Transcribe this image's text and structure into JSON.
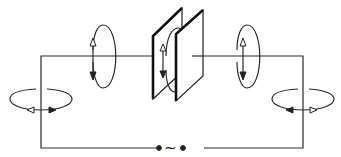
{
  "diagram": {
    "source": {
      "symbol": "~",
      "label": "AC source"
    },
    "components": [
      "capacitor-plates",
      "wire-circuit",
      "ac-source"
    ],
    "field_loops": [
      {
        "id": "top-left",
        "orientation": "vertical",
        "arrows": [
          "hollow-up",
          "filled-down"
        ]
      },
      {
        "id": "between-plates",
        "orientation": "vertical",
        "arrows": [
          "hollow-up",
          "filled-down"
        ]
      },
      {
        "id": "top-right",
        "orientation": "vertical",
        "arrows": [
          "hollow-up",
          "filled-down"
        ]
      },
      {
        "id": "left-wire",
        "orientation": "horizontal",
        "arrows": [
          "hollow-left",
          "filled-right"
        ]
      },
      {
        "id": "right-wire",
        "orientation": "horizontal",
        "arrows": [
          "filled-left",
          "hollow-right"
        ]
      }
    ],
    "colors": {
      "line": "#222222",
      "background": "#ffffff"
    }
  }
}
